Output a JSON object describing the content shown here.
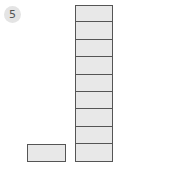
{
  "problem": {
    "number": "5"
  },
  "diagram": {
    "tall_column": {
      "cell_count": 9,
      "fill": "#e8e8e8",
      "stroke": "#555555"
    },
    "single_block": {
      "cell_count": 1,
      "fill": "#e8e8e8",
      "stroke": "#555555"
    }
  }
}
